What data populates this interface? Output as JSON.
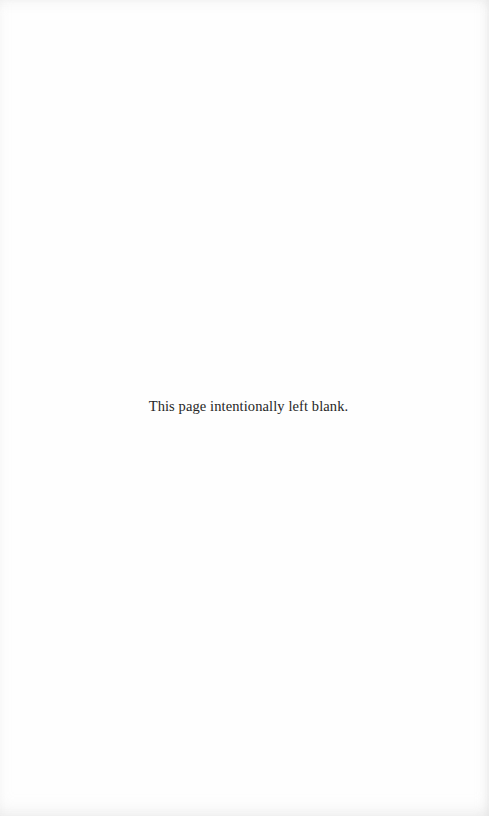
{
  "page": {
    "notice": "This page intentionally left blank."
  }
}
